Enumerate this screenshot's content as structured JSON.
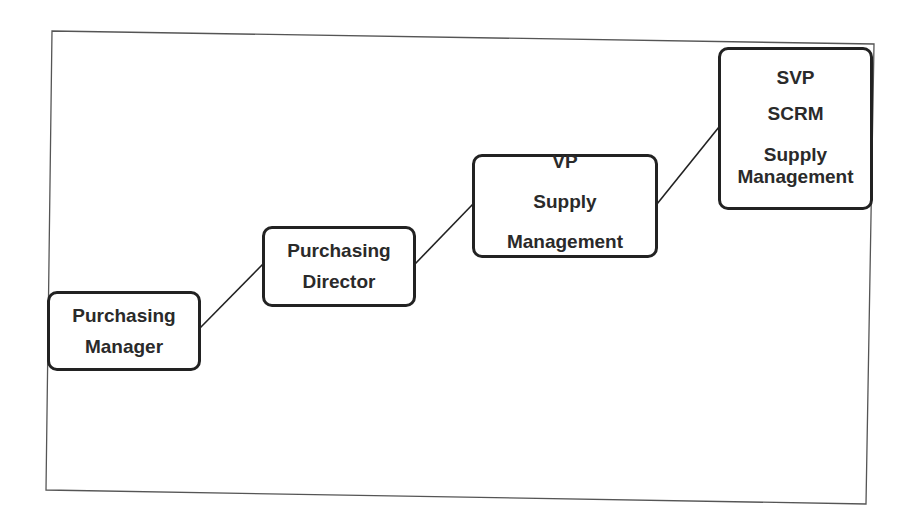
{
  "diagram": {
    "type": "career-ladder",
    "frame_color": "#555555",
    "box_border_color": "#222222",
    "text_color": "#2a2a2a",
    "nodes": [
      {
        "id": "node-1",
        "lines": [
          "Purchasing",
          "Manager"
        ]
      },
      {
        "id": "node-2",
        "lines": [
          "Purchasing",
          "Director"
        ]
      },
      {
        "id": "node-3",
        "lines": [
          "VP",
          "Supply",
          "Management"
        ]
      },
      {
        "id": "node-4",
        "lines": [
          "SVP",
          "SCRM",
          "Supply",
          "Management"
        ]
      }
    ],
    "edges": [
      {
        "from": "node-1",
        "to": "node-2"
      },
      {
        "from": "node-2",
        "to": "node-3"
      },
      {
        "from": "node-3",
        "to": "node-4"
      }
    ]
  }
}
